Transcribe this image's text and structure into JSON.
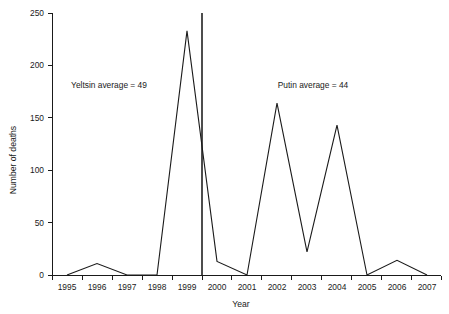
{
  "chart_data": {
    "type": "line",
    "title": "",
    "xlabel": "Year",
    "ylabel": "Number of deaths",
    "x": [
      1995,
      1996,
      1997,
      1998,
      1999,
      2000,
      2001,
      2002,
      2003,
      2004,
      2005,
      2006,
      2007
    ],
    "categories": [
      "1995",
      "1996",
      "1997",
      "1998",
      "1999",
      "2000",
      "2001",
      "2002",
      "2003",
      "2004",
      "2005",
      "2006",
      "2007"
    ],
    "values": [
      0,
      11,
      0,
      0,
      233,
      13,
      0,
      164,
      22,
      143,
      0,
      14,
      0
    ],
    "series": [
      {
        "name": "Number of deaths",
        "values": [
          0,
          11,
          0,
          0,
          233,
          13,
          0,
          164,
          22,
          143,
          0,
          14,
          0
        ]
      }
    ],
    "xlim": [
      1994.6,
      2007.6
    ],
    "ylim": [
      0,
      250
    ],
    "ytick_values": [
      0,
      50,
      100,
      150,
      200,
      250
    ],
    "ytick_labels": [
      "0",
      "50",
      "100",
      "150",
      "200",
      "250"
    ],
    "xtick_labels": [
      "1995",
      "1996",
      "1997",
      "1998",
      "1999",
      "2000",
      "2001",
      "2002",
      "2003",
      "2004",
      "2005",
      "2006",
      "2007"
    ],
    "grid": false,
    "legend": false,
    "line_color": "#1a1a1a",
    "axis_color": "#1a1a1a",
    "divider_color": "#4d4d4d",
    "background_color": "#ffffff",
    "annotations": [
      {
        "id": "yeltsin",
        "text": "Yeltsin average = 49",
        "x": 1996.4,
        "y": 178
      },
      {
        "id": "putin",
        "text": "Putin average = 44",
        "x": 2003.2,
        "y": 178
      },
      {
        "id": "era-divider",
        "text": "",
        "x": 1999.5,
        "y": 250
      }
    ]
  }
}
